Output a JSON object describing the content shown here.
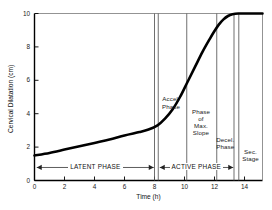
{
  "chart_data": {
    "type": "line",
    "title": "",
    "xlabel": "Time (h)",
    "ylabel": "Cervical Dilatation (cm)",
    "xlim": [
      0,
      15.2
    ],
    "ylim": [
      0,
      10
    ],
    "xticks": [
      0,
      2,
      4,
      6,
      8,
      10,
      12,
      14
    ],
    "xtick_labels": [
      "0",
      "2",
      "4",
      "6",
      "8",
      "10",
      "12",
      "14"
    ],
    "yticks": [
      0,
      2,
      4,
      6,
      8,
      10
    ],
    "ytick_labels": [
      "0",
      "2",
      "4",
      "6",
      "8",
      "10"
    ],
    "grid": false,
    "legend": "none",
    "series": [
      {
        "name": "Cervical dilatation curve (Friedman curve)",
        "x": [
          0.0,
          1.0,
          2.0,
          3.0,
          4.0,
          5.0,
          6.0,
          7.0,
          7.6,
          8.2,
          8.7,
          9.2,
          9.7,
          10.2,
          10.7,
          11.2,
          11.7,
          12.0,
          12.3,
          12.6,
          12.9,
          13.2,
          13.6,
          14.0,
          15.2
        ],
        "values": [
          1.5,
          1.65,
          1.85,
          2.05,
          2.25,
          2.45,
          2.7,
          2.9,
          3.05,
          3.3,
          3.7,
          4.25,
          5.0,
          5.9,
          6.8,
          7.7,
          8.5,
          8.95,
          9.35,
          9.65,
          9.85,
          9.95,
          10.0,
          10.0,
          10.0
        ]
      }
    ],
    "dividers": [
      {
        "name": "latent-active-boundary-a",
        "x": 8.0
      },
      {
        "name": "latent-active-boundary-b",
        "x": 8.25
      },
      {
        "name": "accel-maxslope-boundary",
        "x": 10.15
      },
      {
        "name": "maxslope-decel-boundary",
        "x": 12.15
      },
      {
        "name": "decel-end-boundary",
        "x": 13.3
      },
      {
        "name": "sec-stage-start",
        "x": 13.62
      }
    ],
    "phase_labels": [
      {
        "name": "accel-phase",
        "lines": [
          "Accel.",
          "Phase"
        ],
        "x": 9.1,
        "y_top": 5.1
      },
      {
        "name": "phase-of-max-slope",
        "lines": [
          "Phase",
          "of",
          "Max.",
          "Slope"
        ],
        "x": 11.1,
        "y_top": 4.35
      },
      {
        "name": "decel-phase",
        "lines": [
          "Decel.",
          "Phase"
        ],
        "x": 12.72,
        "y_top": 2.65
      },
      {
        "name": "sec-stage",
        "lines": [
          "Sec.",
          "Stage"
        ],
        "x": 14.4,
        "y_top": 1.95
      }
    ],
    "span_bars": [
      {
        "name": "latent-phase-span",
        "label": "LATENT PHASE",
        "x0": 0.15,
        "x1": 7.95,
        "y": 0.78
      },
      {
        "name": "active-phase-span",
        "label": "ACTIVE PHASE",
        "x0": 8.35,
        "x1": 13.25,
        "y": 0.78
      }
    ]
  }
}
